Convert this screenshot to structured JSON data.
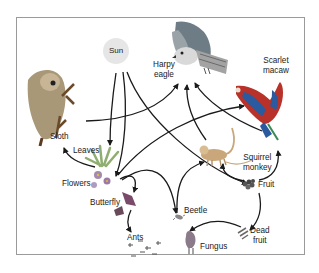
{
  "nodes": {
    "sun": "Sun",
    "harpy_eagle": [
      "Harpy",
      "eagle"
    ],
    "scarlet_macaw": [
      "Scarlet",
      "macaw"
    ],
    "sloth": "Sloth",
    "leaves": "Leaves",
    "flowers": "Flowers",
    "butterfly": "Butterfly",
    "ants": "Ants",
    "beetle": "Beetle",
    "fungus": "Fungus",
    "squirrel_monkey": [
      "Squirrel",
      "monkey"
    ],
    "fruit": "Fruit",
    "dead_fruit": [
      "Dead",
      "fruit"
    ]
  },
  "edges": [
    {
      "from": "Sun",
      "to": "Leaves"
    },
    {
      "from": "Sun",
      "to": "Flowers"
    },
    {
      "from": "Sun",
      "to": "Fruit"
    },
    {
      "from": "Leaves",
      "to": "Sloth"
    },
    {
      "from": "Sloth",
      "to": "Harpy eagle"
    },
    {
      "from": "Flowers",
      "to": "Butterfly"
    },
    {
      "from": "Flowers",
      "to": "Scarlet macaw"
    },
    {
      "from": "Flowers",
      "to": "Beetle"
    },
    {
      "from": "Butterfly",
      "to": "Ants"
    },
    {
      "from": "Beetle",
      "to": "Squirrel monkey"
    },
    {
      "from": "Squirrel monkey",
      "to": "Harpy eagle"
    },
    {
      "from": "Scarlet macaw",
      "to": "Harpy eagle"
    },
    {
      "from": "Fruit",
      "to": "Squirrel monkey"
    },
    {
      "from": "Fruit",
      "to": "Scarlet macaw"
    },
    {
      "from": "Fruit",
      "to": "Dead fruit"
    },
    {
      "from": "Dead fruit",
      "to": "Fungus"
    }
  ],
  "colors": {
    "frame": "#9a9a9a",
    "arrow": "#1a1a1a",
    "sun": "#e6e6e6",
    "macaw_red": "#c0392b",
    "macaw_blue": "#2a4d8f",
    "eagle_gray": "#8c8c8c",
    "sloth_brown": "#a08560",
    "monkey": "#c9a77a",
    "leaves_green": "#8aa86a",
    "flowers_purple": "#9b7aa8"
  }
}
